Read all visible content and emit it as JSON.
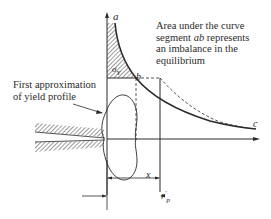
{
  "diagram": {
    "type": "crack-tip yield zone stress distribution",
    "annotation": {
      "line1_pre": "Area under the curve",
      "line2_pre": "segment ",
      "line2_ital": "ab",
      "line2_post": " represents",
      "line3": "an imbalance in the",
      "line4": "equilibrium"
    },
    "yield_label": {
      "line1": "First approximation",
      "line2": "of yield profile"
    },
    "points": {
      "a": "a",
      "b": "b",
      "c": "c"
    },
    "stress_label": {
      "symbol": "σ",
      "subscript": "Y"
    },
    "dimensions": {
      "x": "x",
      "r_symbol": "r",
      "r_superscript": "′",
      "r_subscript": "p"
    },
    "colors": {
      "line": "#2a2a2a",
      "hatch": "#3a3a3a",
      "background": "#ffffff"
    }
  }
}
